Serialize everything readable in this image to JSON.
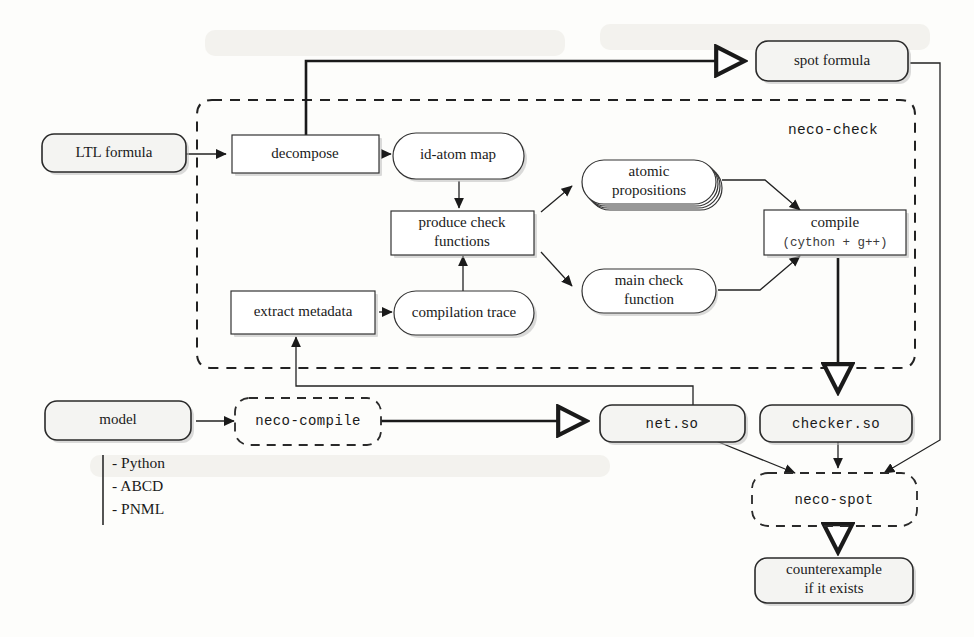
{
  "diagram": {
    "regions": [
      {
        "id": "neco-check",
        "label": "neco-check"
      }
    ],
    "nodes": [
      {
        "id": "ltl-formula",
        "label": "LTL formula",
        "kind": "data-rounded"
      },
      {
        "id": "decompose",
        "label": "decompose",
        "kind": "process-rect"
      },
      {
        "id": "id-atom-map",
        "label": "id-atom map",
        "kind": "data-stadium"
      },
      {
        "id": "produce-check",
        "label_line1": "produce check",
        "label_line2": "functions",
        "kind": "process-rect"
      },
      {
        "id": "atomic-propositions",
        "label_line1": "atomic",
        "label_line2": "propositions",
        "kind": "data-stadium-stack"
      },
      {
        "id": "main-check-function",
        "label_line1": "main check",
        "label_line2": "function",
        "kind": "data-stadium"
      },
      {
        "id": "compile",
        "label_line1": "compile",
        "label_line2": "(cython + g++)",
        "kind": "process-rect"
      },
      {
        "id": "compilation-trace",
        "label": "compilation trace",
        "kind": "data-stadium"
      },
      {
        "id": "extract-metadata",
        "label": "extract metadata",
        "kind": "process-rect"
      },
      {
        "id": "spot-formula",
        "label": "spot formula",
        "kind": "data-rounded"
      },
      {
        "id": "model",
        "label": "model",
        "kind": "data-rounded"
      },
      {
        "id": "neco-compile",
        "label": "neco-compile",
        "kind": "tool-dashed"
      },
      {
        "id": "net-so",
        "label": "net.so",
        "kind": "data-rounded"
      },
      {
        "id": "checker-so",
        "label": "checker.so",
        "kind": "data-rounded"
      },
      {
        "id": "neco-spot",
        "label": "neco-spot",
        "kind": "tool-dashed"
      },
      {
        "id": "counterexample",
        "label_line1": "counterexample",
        "label_line2": "if it exists",
        "kind": "data-rounded"
      }
    ],
    "model_formats": {
      "items": [
        "- Python",
        "- ABCD",
        "- PNML"
      ]
    },
    "colors": {
      "node_fill": "#f4f4f2",
      "node_stroke": "#2a2a2a",
      "plain_fill": "#ffffff",
      "edge": "#222222",
      "background": "#fdfdfb"
    }
  }
}
